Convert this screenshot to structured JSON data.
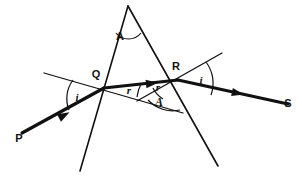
{
  "figure": {
    "kind": "optics-ray-diagram",
    "width": 302,
    "height": 176,
    "background_color": "#ffffff",
    "ink_color": "#111111"
  },
  "points": [
    {
      "id": "apex",
      "label": "A",
      "x": 128,
      "y": 6,
      "role": "prism-apex"
    },
    {
      "id": "Q",
      "label": "Q",
      "x": 104,
      "y": 88,
      "role": "entry-point"
    },
    {
      "id": "R",
      "label": "R",
      "x": 178,
      "y": 80,
      "role": "exit-point"
    },
    {
      "id": "P",
      "label": "P",
      "x": 22,
      "y": 135,
      "role": "incident-ray-start"
    },
    {
      "id": "S",
      "label": "S",
      "x": 288,
      "y": 104,
      "role": "emergent-ray-end"
    }
  ],
  "labels": {
    "apex_label": "A",
    "q_label": "Q",
    "r_label": "R",
    "p_label": "P",
    "s_label": "S",
    "angle_incidence_left": "i",
    "angle_refraction_left": "r",
    "angle_refraction_right": "r",
    "angle_emergence_right": "i",
    "angle_prism_apex": "A",
    "angle_prism_inner": "A"
  },
  "rays": [
    {
      "id": "incident",
      "name": "incident-ray-PQ",
      "from": "P",
      "to": "Q",
      "weight": "thick",
      "arrow": true,
      "arrow_at": {
        "x": 59,
        "y": 118
      },
      "path": "M 22,133 L 104,88"
    },
    {
      "id": "internal",
      "name": "internal-ray-QR",
      "from": "Q",
      "to": "R",
      "weight": "thick",
      "arrow": true,
      "arrow_at": {
        "x": 146,
        "y": 84
      },
      "path": "M 104,88 L 178,80"
    },
    {
      "id": "emergent",
      "name": "emergent-ray-RS",
      "from": "R",
      "to": "S",
      "weight": "thick",
      "arrow": true,
      "arrow_at": {
        "x": 232,
        "y": 92
      },
      "path": "M 178,80 L 288,104"
    }
  ],
  "normals": [
    {
      "id": "normal-q",
      "name": "normal-at-Q",
      "weight": "thin",
      "path": "M 44,73 L 183,113"
    },
    {
      "id": "normal-r",
      "name": "normal-at-R",
      "weight": "thin",
      "path": "M 222,53 L 137,101"
    }
  ],
  "prism": {
    "name": "triangular-prism-outline",
    "left_face_path": "M 128,6 L 80,171",
    "right_face_path": "M 128,6 L 218,166"
  },
  "angle_arcs": [
    {
      "id": "arc-apex-A",
      "name": "angle-arc-apex-A",
      "path": "M 116,33 A 16,16 0 0 0 141,33"
    },
    {
      "id": "arc-i-left",
      "name": "angle-arc-incidence-i",
      "path": "M 73,80 A 31,31 0 0 0 69,110"
    },
    {
      "id": "arc-r-left",
      "name": "angle-arc-refraction-r",
      "path": "M 141,84 A 38,38 0 0 0 137,97"
    },
    {
      "id": "arc-r-right",
      "name": "angle-arc-refraction-r2",
      "path": "M 153,88 A 26,26 0 0 0 163,99"
    },
    {
      "id": "arc-A-inner",
      "name": "angle-arc-inner-A",
      "path": "M 148,100 A 34,34 0 0 0 180,110"
    },
    {
      "id": "arc-i-right",
      "name": "angle-arc-emergence-i",
      "path": "M 206,62 A 35,35 0 0 1 211,95"
    }
  ],
  "caption": "Light ray P enters the prism at Q, refracts along QR, and emerges at R toward S."
}
